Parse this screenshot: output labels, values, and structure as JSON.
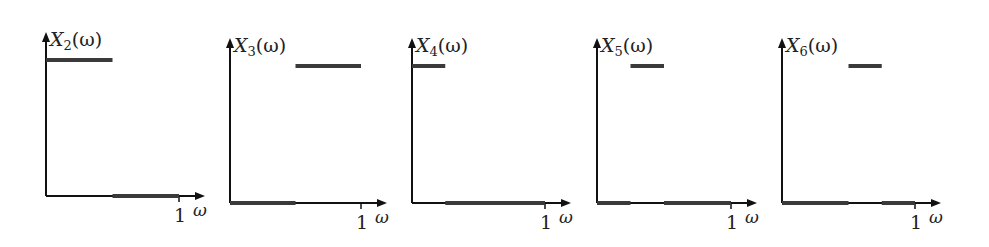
{
  "chart_data": {
    "type": "line",
    "title": "",
    "panels": [
      {
        "ylabel": "X",
        "sub": "2",
        "arg": "(ω)",
        "xlabel": "ω",
        "tick": "1",
        "high_band": [
          0,
          0.5
        ],
        "low_segments": [
          [
            0.5,
            1.0
          ]
        ]
      },
      {
        "ylabel": "X",
        "sub": "3",
        "arg": "(ω)",
        "xlabel": "ω",
        "tick": "1",
        "high_band": [
          0.5,
          1.0
        ],
        "low_segments": [
          [
            0,
            0.5
          ]
        ]
      },
      {
        "ylabel": "X",
        "sub": "4",
        "arg": "(ω)",
        "xlabel": "ω",
        "tick": "1",
        "high_band": [
          0,
          0.25
        ],
        "low_segments": [
          [
            0.25,
            1.0
          ]
        ]
      },
      {
        "ylabel": "X",
        "sub": "5",
        "arg": "(ω)",
        "xlabel": "ω",
        "tick": "1",
        "high_band": [
          0.25,
          0.5
        ],
        "low_segments": [
          [
            0,
            0.25
          ],
          [
            0.5,
            1.0
          ]
        ]
      },
      {
        "ylabel": "X",
        "sub": "6",
        "arg": "(ω)",
        "xlabel": "ω",
        "tick": "1",
        "high_band": [
          0.5,
          0.75
        ],
        "low_segments": [
          [
            0,
            0.5
          ],
          [
            0.75,
            1.0
          ]
        ]
      }
    ]
  },
  "layout": {
    "panels": [
      {
        "x0": 46,
        "y0": 196,
        "top": 32,
        "unit": 133,
        "high_y": 60
      },
      {
        "x0": 230,
        "y0": 203,
        "top": 38,
        "unit": 131,
        "high_y": 66
      },
      {
        "x0": 412,
        "y0": 203,
        "top": 38,
        "unit": 133,
        "high_y": 66
      },
      {
        "x0": 597,
        "y0": 203,
        "top": 38,
        "unit": 134,
        "high_y": 66
      },
      {
        "x0": 782,
        "y0": 203,
        "top": 38,
        "unit": 133,
        "high_y": 66
      }
    ],
    "axis_color": "#111111",
    "band_color": "#3a3a3a"
  }
}
